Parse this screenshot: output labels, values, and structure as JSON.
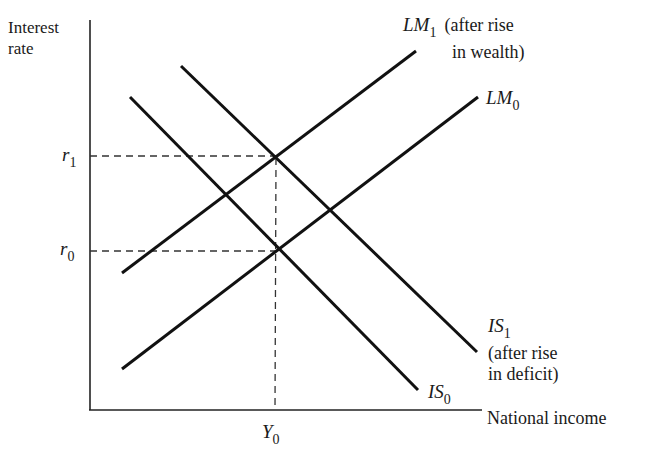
{
  "diagram": {
    "type": "IS-LM diagram",
    "y_axis": {
      "label_line1": "Interest",
      "label_line2": "rate"
    },
    "x_axis": {
      "label": "National income"
    },
    "ticks": {
      "r1": {
        "base": "r",
        "sub": "1"
      },
      "r0": {
        "base": "r",
        "sub": "0"
      },
      "y0": {
        "base": "Y",
        "sub": "0"
      }
    },
    "curves": [
      {
        "id": "LM1",
        "base": "LM",
        "sub": "1",
        "note_line1": "(after rise",
        "note_line2": "in wealth)",
        "slope": "upward"
      },
      {
        "id": "LM0",
        "base": "LM",
        "sub": "0",
        "slope": "upward"
      },
      {
        "id": "IS1",
        "base": "IS",
        "sub": "1",
        "note_line1": "(after rise",
        "note_line2": "in deficit)",
        "slope": "downward"
      },
      {
        "id": "IS0",
        "base": "IS",
        "sub": "0",
        "slope": "downward"
      }
    ],
    "equilibria": [
      {
        "curves": "IS0 ∩ LM0",
        "rate": "r0",
        "income": "Y0"
      },
      {
        "curves": "IS1 ∩ LM1",
        "rate": "r1",
        "income": "Y0"
      }
    ],
    "colors": {
      "line": "#111111",
      "text": "#1a1a1a",
      "background": "#ffffff"
    }
  }
}
